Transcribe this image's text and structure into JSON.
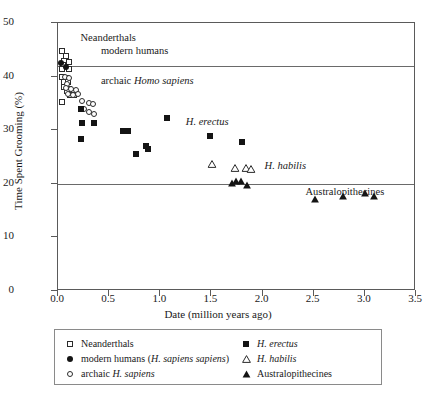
{
  "chart_data": {
    "type": "scatter",
    "title": "",
    "xlabel": "Date (million years ago)",
    "ylabel": "Time Spent Grooming (%)",
    "xlim": [
      0.0,
      3.5
    ],
    "ylim": [
      0,
      50
    ],
    "xticks": [
      "0.0",
      "0.5",
      "1.0",
      "1.5",
      "2.0",
      "2.5",
      "3.0",
      "3.5"
    ],
    "yticks": [
      "0",
      "10",
      "20",
      "30",
      "40",
      "50"
    ],
    "grid": "horizontal gridlines at y=42 and y=20",
    "gridlines_y": [
      42,
      20
    ],
    "legend_position": "below-plot",
    "annotations": [
      {
        "text": "Neanderthals",
        "x": 0.22,
        "y": 47.0
      },
      {
        "text": "modern humans",
        "x": 0.42,
        "y": 44.6
      },
      {
        "text": "archaic Homo sapiens",
        "x": 0.42,
        "y": 39.0
      },
      {
        "text": "H. erectus",
        "x": 1.25,
        "y": 31.3
      },
      {
        "text": "H. habilis",
        "x": 2.02,
        "y": 23.2
      },
      {
        "text": "Australopithecines",
        "x": 2.42,
        "y": 18.2
      }
    ],
    "series": [
      {
        "name": "Neanderthals",
        "marker": "open-square",
        "color": "#2b2b2b",
        "points": [
          [
            0.035,
            44.8
          ],
          [
            0.075,
            43.9
          ],
          [
            0.055,
            43.0
          ],
          [
            0.105,
            42.8
          ],
          [
            0.045,
            42.1
          ],
          [
            0.04,
            41.4
          ],
          [
            0.105,
            41.5
          ],
          [
            0.04,
            39.9
          ],
          [
            0.08,
            39.8
          ],
          [
            0.055,
            38.9
          ],
          [
            0.1,
            39.0
          ],
          [
            0.06,
            38.1
          ],
          [
            0.11,
            37.6
          ],
          [
            0.135,
            37.4
          ],
          [
            0.155,
            37.2
          ],
          [
            0.085,
            37.3
          ],
          [
            0.12,
            36.6
          ],
          [
            0.16,
            36.5
          ],
          [
            0.035,
            35.2
          ]
        ]
      },
      {
        "name": "modern humans (H. sapiens sapiens)",
        "marker": "filled-circle",
        "color": "#141414",
        "points": [
          [
            0.03,
            42.5
          ],
          [
            0.075,
            41.8
          ]
        ]
      },
      {
        "name": "archaic H. sapiens",
        "marker": "open-circle",
        "color": "#2b2b2b",
        "points": [
          [
            0.065,
            39.9
          ],
          [
            0.11,
            39.7
          ],
          [
            0.09,
            38.7
          ],
          [
            0.075,
            37.9
          ],
          [
            0.13,
            37.6
          ],
          [
            0.18,
            37.5
          ],
          [
            0.1,
            36.8
          ],
          [
            0.145,
            36.6
          ],
          [
            0.195,
            36.7
          ],
          [
            0.23,
            35.4
          ],
          [
            0.3,
            35.0
          ],
          [
            0.345,
            34.8
          ],
          [
            0.25,
            33.9
          ],
          [
            0.3,
            33.4
          ],
          [
            0.355,
            33.1
          ]
        ]
      },
      {
        "name": "H. erectus",
        "marker": "filled-square",
        "color": "#141414",
        "points": [
          [
            0.225,
            34.0
          ],
          [
            0.23,
            31.4
          ],
          [
            0.225,
            28.4
          ],
          [
            0.355,
            31.4
          ],
          [
            0.64,
            29.9
          ],
          [
            0.68,
            29.8
          ],
          [
            0.76,
            25.5
          ],
          [
            0.86,
            27.0
          ],
          [
            0.88,
            26.4
          ],
          [
            1.065,
            32.2
          ],
          [
            1.49,
            29.0
          ],
          [
            1.8,
            27.8
          ]
        ]
      },
      {
        "name": "H. habilis",
        "marker": "open-triangle",
        "color": "#2b2b2b",
        "points": [
          [
            1.51,
            23.8
          ],
          [
            1.735,
            23.2
          ],
          [
            1.84,
            23.2
          ],
          [
            1.89,
            23.0
          ]
        ]
      },
      {
        "name": "Australopithecines",
        "marker": "filled-triangle",
        "color": "#141414",
        "points": [
          [
            1.7,
            20.4
          ],
          [
            1.745,
            20.8
          ],
          [
            1.79,
            20.8
          ],
          [
            1.845,
            20.0
          ],
          [
            2.51,
            17.3
          ],
          [
            2.79,
            18.0
          ],
          [
            3.0,
            18.5
          ],
          [
            3.085,
            17.9
          ]
        ]
      }
    ]
  },
  "legend": {
    "entries": [
      {
        "marker": "open-square",
        "label": "Neanderthals",
        "italic_part": ""
      },
      {
        "marker": "filled-circle",
        "label": "modern humans (",
        "italic_part": "H. sapiens sapiens",
        "tail": ")"
      },
      {
        "marker": "open-circle",
        "label": "archaic ",
        "italic_part": "H. sapiens",
        "tail": ""
      },
      {
        "marker": "filled-square",
        "label": "",
        "italic_part": "H. erectus",
        "tail": ""
      },
      {
        "marker": "open-triangle",
        "label": "",
        "italic_part": "H. habilis",
        "tail": ""
      },
      {
        "marker": "filled-triangle",
        "label": "Australopithecines",
        "italic_part": "",
        "tail": ""
      }
    ]
  },
  "colors": {
    "frame": "#5a5a5a",
    "gridline": "#6a6a6a",
    "marker_dark": "#141414",
    "marker_outline": "#2b2b2b",
    "background": "#ffffff"
  }
}
